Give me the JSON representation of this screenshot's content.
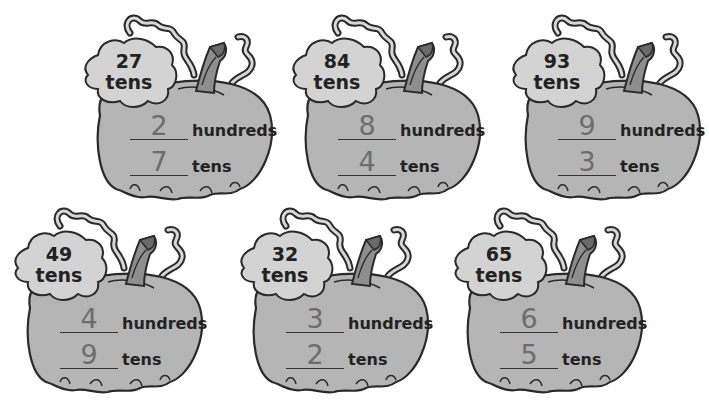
{
  "worksheet": {
    "pumpkins": [
      {
        "total_number": "27",
        "total_unit": "tens",
        "hundreds_answer": "2",
        "hundreds_label": "hundreds",
        "tens_answer": "7",
        "tens_label": "tens",
        "pos": {
          "x": 60,
          "y": 5
        }
      },
      {
        "total_number": "84",
        "total_unit": "tens",
        "hundreds_answer": "8",
        "hundreds_label": "hundreds",
        "tens_answer": "4",
        "tens_label": "tens",
        "pos": {
          "x": 268,
          "y": 5
        }
      },
      {
        "total_number": "93",
        "total_unit": "tens",
        "hundreds_answer": "9",
        "hundreds_label": "hundreds",
        "tens_answer": "3",
        "tens_label": "tens",
        "pos": {
          "x": 488,
          "y": 5
        }
      },
      {
        "total_number": "49",
        "total_unit": "tens",
        "hundreds_answer": "4",
        "hundreds_label": "hundreds",
        "tens_answer": "9",
        "tens_label": "tens",
        "pos": {
          "x": -10,
          "y": 198
        }
      },
      {
        "total_number": "32",
        "total_unit": "tens",
        "hundreds_answer": "3",
        "hundreds_label": "hundreds",
        "tens_answer": "2",
        "tens_label": "tens",
        "pos": {
          "x": 216,
          "y": 198
        }
      },
      {
        "total_number": "65",
        "total_unit": "tens",
        "hundreds_answer": "6",
        "hundreds_label": "hundreds",
        "tens_answer": "5",
        "tens_label": "tens",
        "pos": {
          "x": 430,
          "y": 198
        }
      }
    ]
  },
  "colors": {
    "pumpkin_fill": "#b5b5b5",
    "bubble_fill": "#d3d3d3",
    "stem_fill": "#8e8e8e",
    "outline": "#2a2a2a",
    "handwriting": "#6d6d6d"
  }
}
